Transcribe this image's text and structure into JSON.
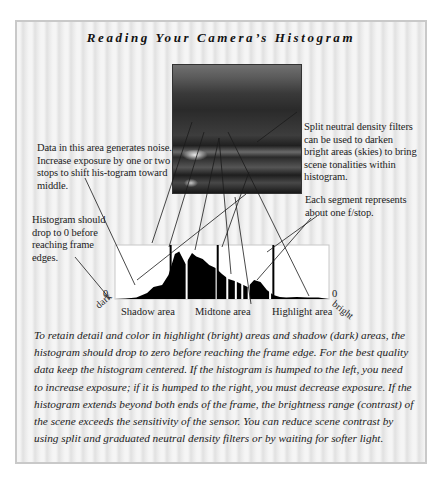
{
  "figure": {
    "title": "Reading Your Camera’s Histogram",
    "photo": {
      "alt": "sunset-seascape-photo"
    }
  },
  "annotations": {
    "data_area": "Data in this area generates noise. Increase exposure by one or two stops to shift his-togram toward middle.",
    "drop_to_zero": "Histogram should drop to 0 before reaching frame edges.",
    "split_nd": "Split neutral density filters can be used to darken bright areas (skies) to bring scene tonalities within histogram.",
    "segment": "Each segment represents about one f/stop."
  },
  "histogram": {
    "zero_left": "0",
    "zero_right": "0",
    "dark_label": "dark",
    "bright_label": "bright",
    "zones": [
      "Shadow area",
      "Midtone area",
      "Highlight area"
    ],
    "segment_markers": 3,
    "colors": {
      "fill": "#000000",
      "frame": "#ffffff",
      "frame_border": "#c8c8c8"
    }
  },
  "body": {
    "paragraph": "To retain detail and color in highlight (bright) areas and shadow (dark) areas, the histogram should drop to zero before reaching the frame edge. For the best quality data keep the histogram centered. If the histogram is humped to the left, you need to increase exposure; if it is humped to the right, you must decrease exposure. If the histogram extends beyond both ends of the frame, the brightness range (contrast) of the scene exceeds the sensitivity of the sensor. You can reduce scene contrast by using split and graduated neutral density filters or by waiting for softer light."
  },
  "chart_data": {
    "type": "area",
    "title": "Reading Your Camera’s Histogram",
    "xlabel": "dark → bright (tonal range)",
    "ylabel": "pixel count",
    "x_ticks": [
      "0 (dark)",
      "Shadow area",
      "Midtone area",
      "Highlight area",
      "0 (bright)"
    ],
    "x": [
      0,
      5,
      10,
      15,
      18,
      22,
      25,
      28,
      30,
      33,
      36,
      38,
      41,
      44,
      47,
      50,
      53,
      56,
      59,
      62,
      65,
      68,
      71,
      74,
      77,
      80,
      85,
      90,
      95,
      100
    ],
    "values": [
      0,
      1,
      3,
      12,
      24,
      28,
      48,
      90,
      95,
      70,
      92,
      85,
      80,
      68,
      62,
      50,
      40,
      36,
      30,
      24,
      38,
      34,
      18,
      8,
      4,
      3,
      4,
      3,
      3,
      0
    ],
    "segment_dividers_pct": [
      26,
      48,
      74
    ],
    "ylim": [
      0,
      100
    ],
    "grid": false
  }
}
